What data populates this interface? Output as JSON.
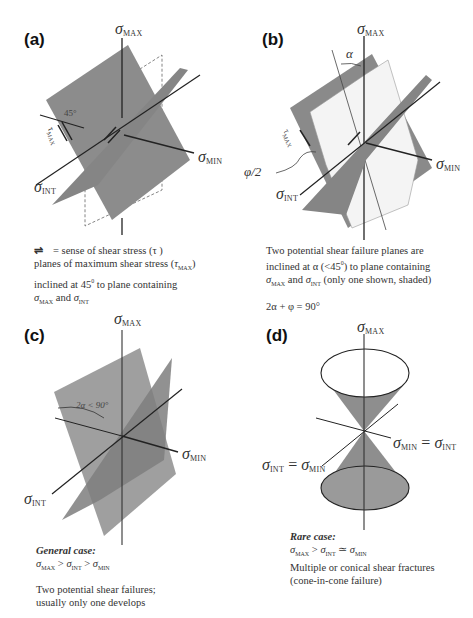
{
  "figure": {
    "panels": [
      {
        "id": "a",
        "label": "(a)",
        "axes": {
          "max": "MAX",
          "min": "MIN",
          "int": "INT"
        },
        "angle_label": "45°",
        "tau_label": "MAX",
        "caption": {
          "line1_symbol": "⇌",
          "line1": "= sense of shear stress (τ )",
          "line2_pre": "planes of maximum shear stress (",
          "line2_tau_sub": "MAX",
          "line2_post": ")",
          "line3_pre": "inclined at 45",
          "line3_sup": "0",
          "line3_post": " to  plane containing",
          "line4_sub1": "MAX",
          "line4_mid": " and ",
          "line4_sub2": "INT"
        }
      },
      {
        "id": "b",
        "label": "(b)",
        "axes": {
          "max": "MAX",
          "min": "MIN",
          "int": "INT"
        },
        "alpha_label": "α",
        "phi_label": "φ/2",
        "tau_label": "MAX",
        "caption": {
          "line1": "Two potential shear failure planes are",
          "line2_pre": "inclined at  α (<45",
          "line2_sup": "0",
          "line2_post": ") to plane containing",
          "line3_sub1": "MAX",
          "line3_mid": " and ",
          "line3_sub2": "INT",
          "line3_post": " (only one shown,  shaded)",
          "equation": "2α + φ  =  90°"
        }
      },
      {
        "id": "c",
        "label": "(c)",
        "axes": {
          "max": "MAX",
          "min": "MIN",
          "int": "INT"
        },
        "angle_label": "2α  <  90°",
        "caption": {
          "heading": "General case:",
          "relation_sub1": "MAX",
          "relation_op1": " >  ",
          "relation_sub2": "INT",
          "relation_op2": "  > ",
          "relation_sub3": "MIN",
          "line1": "Two potential shear failures;",
          "line2": " usually only one develops"
        }
      },
      {
        "id": "d",
        "label": "(d)",
        "axes": {
          "max": "MAX",
          "min_eq_int_a": "MIN",
          "min_eq_int_b": "INT",
          "int_eq_min_a": "INT",
          "int_eq_min_b": "MIN"
        },
        "eq": "=",
        "caption": {
          "heading": "Rare case:",
          "relation_sub1": "MAX",
          "relation_op1": " >  ",
          "relation_sub2": "INT",
          "relation_op2": " ≃ ",
          "relation_sub3": "MIN",
          "line1": "Multiple or conical shear fractures",
          "line2": "(cone-in-cone failure)"
        }
      }
    ],
    "symbols": {
      "sigma": "σ",
      "tau": "τ"
    },
    "colors": {
      "plane": "#8a8a8a",
      "plane_dark": "#7a7a7a",
      "plane_light": "#9a9a9a",
      "line": "#222222",
      "shaded": "#f2f2f2"
    }
  }
}
